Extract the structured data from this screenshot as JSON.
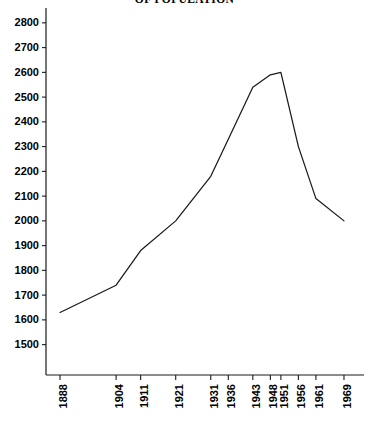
{
  "chart_data": {
    "type": "line",
    "title": "OF POPULATION",
    "xlabel": "",
    "ylabel": "",
    "x": [
      1888,
      1904,
      1911,
      1921,
      1931,
      1936,
      1943,
      1948,
      1951,
      1956,
      1961,
      1969
    ],
    "categories": [
      "1888",
      "1904",
      "1911",
      "1921",
      "1931",
      "1936",
      "1943",
      "1948",
      "1951",
      "1956",
      "1961",
      "1969"
    ],
    "values": [
      1630,
      1740,
      1880,
      2000,
      2180,
      2330,
      2540,
      2590,
      2600,
      2300,
      2090,
      2000
    ],
    "series": [
      {
        "name": "population",
        "values": [
          1630,
          1740,
          1880,
          2000,
          2180,
          2330,
          2540,
          2590,
          2600,
          2300,
          2090,
          2000
        ]
      }
    ],
    "ylim": [
      1450,
      2860
    ],
    "xlim": [
      1884,
      1973
    ],
    "ytick_labels": [
      "2800",
      "2700",
      "2600",
      "2500",
      "2400",
      "2300",
      "2200",
      "2100",
      "2000",
      "1900",
      "1800",
      "1700",
      "1600",
      "1500"
    ],
    "ytick_values": [
      2800,
      2700,
      2600,
      2500,
      2400,
      2300,
      2200,
      2100,
      2000,
      1900,
      1800,
      1700,
      1600,
      1500
    ],
    "xtick_labels": [
      "1888",
      "1904",
      "1911",
      "1921",
      "1931",
      "1936",
      "1943",
      "1948",
      "1951",
      "1956",
      "1961",
      "1969"
    ],
    "xtick_values": [
      1888,
      1904,
      1911,
      1921,
      1931,
      1936,
      1943,
      1948,
      1951,
      1956,
      1961,
      1969
    ],
    "grid": false,
    "legend": false,
    "legend_position": "none",
    "line_color": "#1a1a1a",
    "axis_color": "#1a1a1a",
    "background_color": "#ffffff",
    "xtick_label_rotation": -90
  }
}
